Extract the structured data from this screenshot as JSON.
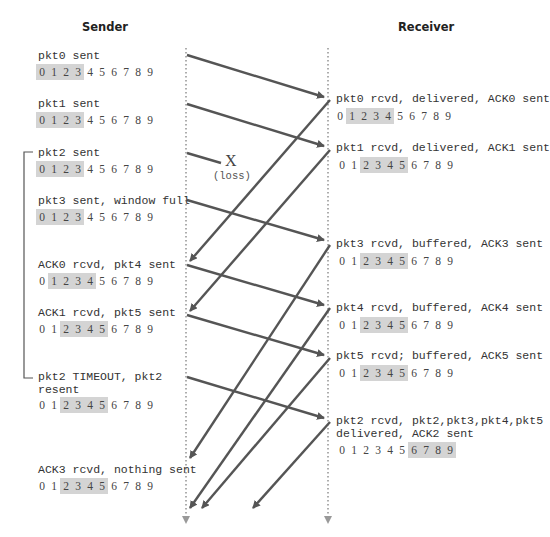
{
  "headers": {
    "sender": "Sender",
    "receiver": "Receiver"
  },
  "colors": {
    "arrow": "#555555",
    "window_highlight": "#d4d4d4",
    "timeline": "#999999"
  },
  "sender_events": [
    {
      "label": "pkt0 sent",
      "window": [
        0,
        1,
        2,
        3
      ]
    },
    {
      "label": "pkt1 sent",
      "window": [
        0,
        1,
        2,
        3
      ]
    },
    {
      "label": "pkt2 sent",
      "window": [
        0,
        1,
        2,
        3
      ]
    },
    {
      "label": "pkt3 sent, window full",
      "window": [
        0,
        1,
        2,
        3
      ]
    },
    {
      "label": "ACK0 rcvd, pkt4 sent",
      "window": [
        1,
        2,
        3,
        4
      ]
    },
    {
      "label": "ACK1 rcvd, pkt5 sent",
      "window": [
        2,
        3,
        4,
        5
      ]
    },
    {
      "label": "pkt2 TIMEOUT, pkt2\nresent",
      "window": [
        2,
        3,
        4,
        5
      ]
    },
    {
      "label": "ACK3 rcvd, nothing sent",
      "window": [
        2,
        3,
        4,
        5
      ]
    }
  ],
  "receiver_events": [
    {
      "label": "pkt0 rcvd, delivered, ACK0 sent",
      "window": [
        1,
        2,
        3,
        4
      ]
    },
    {
      "label": "pkt1 rcvd, delivered, ACK1 sent",
      "window": [
        2,
        3,
        4,
        5
      ]
    },
    {
      "label": "pkt3 rcvd, buffered, ACK3 sent",
      "window": [
        2,
        3,
        4,
        5
      ]
    },
    {
      "label": "pkt4 rcvd, buffered, ACK4 sent",
      "window": [
        2,
        3,
        4,
        5
      ]
    },
    {
      "label": "pkt5 rcvd; buffered, ACK5 sent",
      "window": [
        2,
        3,
        4,
        5
      ]
    },
    {
      "label": "pkt2 rcvd, pkt2,pkt3,pkt4,pkt5\ndelivered, ACK2 sent",
      "window": [
        6,
        7,
        8,
        9
      ]
    }
  ],
  "sequence_numbers": [
    0,
    1,
    2,
    3,
    4,
    5,
    6,
    7,
    8,
    9
  ],
  "loss": {
    "mark": "X",
    "label": "(loss)"
  },
  "messages": [
    {
      "name": "pkt0",
      "dir": "s2r"
    },
    {
      "name": "pkt1",
      "dir": "s2r"
    },
    {
      "name": "pkt2",
      "dir": "s2r",
      "lost": true
    },
    {
      "name": "pkt3",
      "dir": "s2r"
    },
    {
      "name": "ACK0",
      "dir": "r2s"
    },
    {
      "name": "ACK1",
      "dir": "r2s"
    },
    {
      "name": "pkt4",
      "dir": "s2r"
    },
    {
      "name": "pkt5",
      "dir": "s2r"
    },
    {
      "name": "ACK3",
      "dir": "r2s"
    },
    {
      "name": "ACK4",
      "dir": "r2s"
    },
    {
      "name": "pkt2 (resent)",
      "dir": "s2r"
    },
    {
      "name": "ACK5",
      "dir": "r2s"
    },
    {
      "name": "ACK2",
      "dir": "r2s"
    }
  ]
}
